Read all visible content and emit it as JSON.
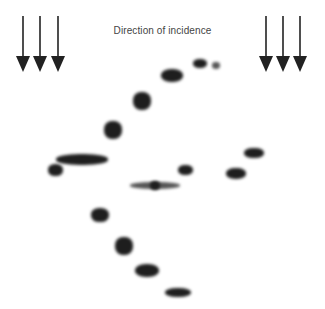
{
  "figure": {
    "label": "Direction of incidence",
    "arrows_left_x": [
      23,
      40,
      58
    ],
    "arrows_right_x": [
      266,
      283,
      300
    ],
    "arrow_color": "#222222",
    "spots": [
      {
        "x": 172,
        "y": 75,
        "w": 22,
        "h": 13,
        "tone": "dark"
      },
      {
        "x": 200,
        "y": 63,
        "w": 14,
        "h": 9,
        "tone": "dark"
      },
      {
        "x": 216,
        "y": 65,
        "w": 8,
        "h": 7,
        "tone": "light"
      },
      {
        "x": 142,
        "y": 101,
        "w": 18,
        "h": 18,
        "tone": "dark"
      },
      {
        "x": 113,
        "y": 130,
        "w": 18,
        "h": 18,
        "tone": "dark"
      },
      {
        "x": 82,
        "y": 159,
        "w": 52,
        "h": 11,
        "tone": "dark"
      },
      {
        "x": 55,
        "y": 170,
        "w": 15,
        "h": 12,
        "tone": "dark"
      },
      {
        "x": 185,
        "y": 170,
        "w": 15,
        "h": 10,
        "tone": "dark"
      },
      {
        "x": 155,
        "y": 185,
        "w": 50,
        "h": 7,
        "tone": "light"
      },
      {
        "x": 155,
        "y": 185,
        "w": 10,
        "h": 9,
        "tone": "dark"
      },
      {
        "x": 254,
        "y": 153,
        "w": 20,
        "h": 10,
        "tone": "dark"
      },
      {
        "x": 236,
        "y": 173,
        "w": 20,
        "h": 11,
        "tone": "dark"
      },
      {
        "x": 100,
        "y": 215,
        "w": 18,
        "h": 14,
        "tone": "dark"
      },
      {
        "x": 124,
        "y": 246,
        "w": 18,
        "h": 18,
        "tone": "dark"
      },
      {
        "x": 147,
        "y": 270,
        "w": 24,
        "h": 13,
        "tone": "dark"
      },
      {
        "x": 178,
        "y": 292,
        "w": 26,
        "h": 9,
        "tone": "dark"
      }
    ]
  }
}
